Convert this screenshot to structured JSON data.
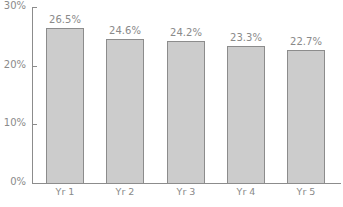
{
  "chart_data": {
    "type": "bar",
    "title": "",
    "xlabel": "",
    "ylabel": "",
    "categories": [
      "Yr 1",
      "Yr 2",
      "Yr 3",
      "Yr 4",
      "Yr 5"
    ],
    "values": [
      26.5,
      24.6,
      24.2,
      23.3,
      22.7
    ],
    "value_labels": [
      "26.5%",
      "24.6%",
      "24.2%",
      "23.3%",
      "22.7%"
    ],
    "ylim": [
      0,
      30
    ],
    "yticks": [
      0,
      10,
      20,
      30
    ],
    "ytick_labels": [
      "0%",
      "10%",
      "20%",
      "30%"
    ],
    "grid": false,
    "legend": null,
    "colors": {
      "bar_fill": "#cccccc",
      "bar_edge": "#8c8c8c",
      "text": "#8a8a8a"
    }
  }
}
